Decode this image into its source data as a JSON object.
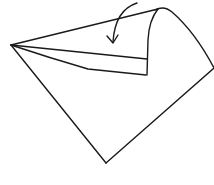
{
  "diagram": {
    "type": "origami-fold-step",
    "stroke_color": "#1a1a1a",
    "background_color": "#ffffff",
    "elements": {
      "paper_outline": "Diamond-shaped paper with left, bottom and right corners",
      "folded_flap": "Triangular flap lifted at top-right corner",
      "fold_arrow": "Curved arrow pointing down, indicating fold direction"
    }
  }
}
